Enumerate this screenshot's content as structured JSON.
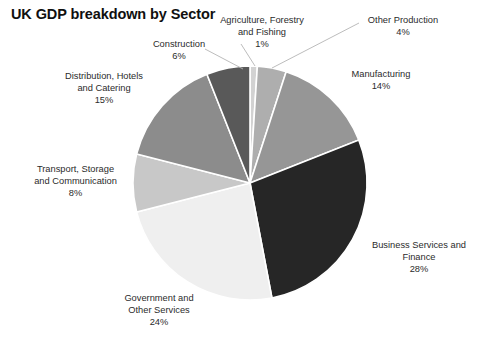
{
  "chart": {
    "title": "UK GDP breakdown by Sector"
  },
  "chart_data": {
    "type": "pie",
    "title": "UK GDP breakdown by Sector",
    "xlabel": "",
    "ylabel": "",
    "legend": "none",
    "grid": false,
    "units": "percent",
    "start_angle_deg": 0,
    "direction": "clockwise",
    "categories": [
      "Agriculture, Forestry and Fishing",
      "Other Production",
      "Manufacturing",
      "Business Services and Finance",
      "Government and Other Services",
      "Transport, Storage and Communication",
      "Distribution, Hotels and Catering",
      "Construction"
    ],
    "values": [
      1,
      4,
      14,
      28,
      24,
      8,
      15,
      6
    ],
    "value_labels": [
      "1%",
      "4%",
      "14%",
      "28%",
      "24%",
      "8%",
      "15%",
      "6%"
    ],
    "colors": [
      "#d2d2d2",
      "#aeaeae",
      "#969696",
      "#262626",
      "#efefef",
      "#c8c8c8",
      "#8c8c8c",
      "#595959"
    ],
    "slice_border_color": "#ffffff",
    "total": 100
  },
  "labels": [
    {
      "name": "Agriculture, Forestry",
      "name2": "and Fishing",
      "value": "1%"
    },
    {
      "name": "Other Production",
      "name2": "",
      "value": "4%"
    },
    {
      "name": "Manufacturing",
      "name2": "",
      "value": "14%"
    },
    {
      "name": "Business Services and",
      "name2": "Finance",
      "value": "28%"
    },
    {
      "name": "Government and",
      "name2": "Other Services",
      "value": "24%"
    },
    {
      "name": "Transport, Storage",
      "name2": "and Communication",
      "value": "8%"
    },
    {
      "name": "Distribution, Hotels",
      "name2": "and Catering",
      "value": "15%"
    },
    {
      "name": "Construction",
      "name2": "",
      "value": "6%"
    }
  ]
}
